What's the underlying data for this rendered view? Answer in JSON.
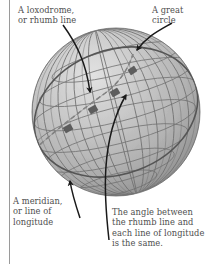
{
  "figure": {
    "type": "globe-diagram",
    "background_color": "#ffffff",
    "sphere": {
      "fill_color": "#b5b5b5",
      "highlight_color": "#dcdcdc",
      "edge_shadow_color": "#8c8c8c",
      "grid_color": "#6f6f6f",
      "center_x": 116,
      "center_y": 112,
      "radius": 84,
      "pole_x": 134,
      "pole_y": 51,
      "meridian_count": 12,
      "parallel_count": 7
    },
    "great_circle": {
      "color": "#5a5a5a",
      "stroke_width": 1.5
    },
    "rhumb_line": {
      "color": "#777777",
      "stroke_width": 1.4,
      "angle_marker_count": 4,
      "angle_marker_color": "#5d5d5d"
    },
    "arrow_color": "#1a1a1a"
  },
  "labels": {
    "loxodrome": "A loxodrome,\nor rhumb line",
    "great_circle": "A great\ncircle",
    "meridian": "A meridian,\nor line of\nlongitude",
    "angle_note": "The angle between\nthe rhumb line and\neach line of longitude\nis the same."
  },
  "colors": {
    "text": "#4f4f4f",
    "rule": "#9a9a9a",
    "arrow": "#1a1a1a"
  }
}
